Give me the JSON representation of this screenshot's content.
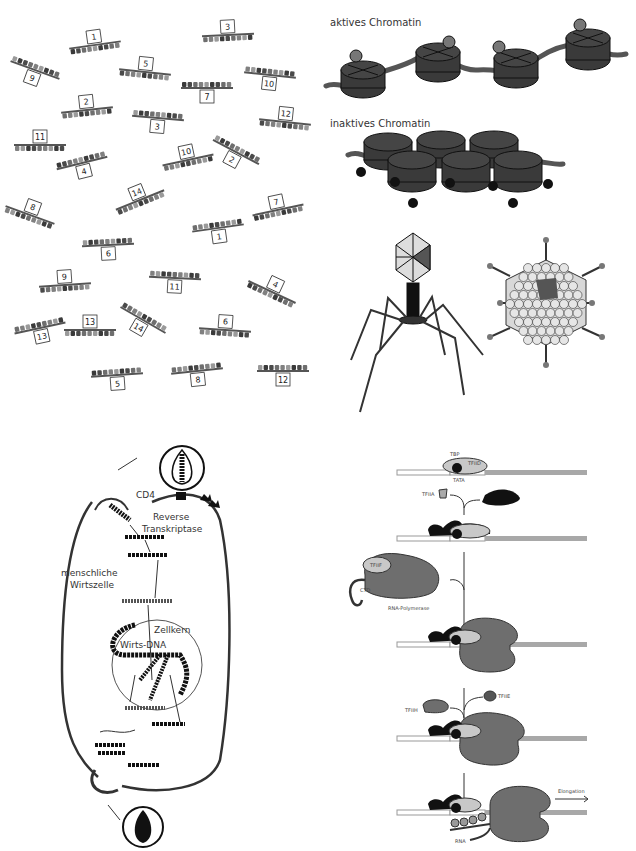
{
  "panels": {
    "genes": {
      "title": "Numbered gene segments",
      "items": [
        {
          "n": "1",
          "x": 95,
          "y": 45,
          "rot": -8,
          "box": "top"
        },
        {
          "n": "3",
          "x": 228,
          "y": 35,
          "rot": -3,
          "box": "top"
        },
        {
          "n": "9",
          "x": 35,
          "y": 70,
          "rot": 20,
          "box": "bottom"
        },
        {
          "n": "5",
          "x": 145,
          "y": 72,
          "rot": 6,
          "box": "top"
        },
        {
          "n": "10",
          "x": 270,
          "y": 75,
          "rot": 6,
          "box": "bottom"
        },
        {
          "n": "7",
          "x": 207,
          "y": 88,
          "rot": 0,
          "box": "bottom"
        },
        {
          "n": "2",
          "x": 87,
          "y": 110,
          "rot": -6,
          "box": "top"
        },
        {
          "n": "3",
          "x": 158,
          "y": 118,
          "rot": 5,
          "box": "bottom"
        },
        {
          "n": "12",
          "x": 285,
          "y": 122,
          "rot": 6,
          "box": "top"
        },
        {
          "n": "11",
          "x": 40,
          "y": 145,
          "rot": 0,
          "box": "top"
        },
        {
          "n": "4",
          "x": 82,
          "y": 163,
          "rot": -14,
          "box": "bottom"
        },
        {
          "n": "10",
          "x": 188,
          "y": 160,
          "rot": -12,
          "box": "top"
        },
        {
          "n": "2",
          "x": 236,
          "y": 152,
          "rot": 28,
          "box": "bottom"
        },
        {
          "n": "14",
          "x": 140,
          "y": 200,
          "rot": -22,
          "box": "top"
        },
        {
          "n": "8",
          "x": 30,
          "y": 215,
          "rot": 20,
          "box": "top"
        },
        {
          "n": "7",
          "x": 278,
          "y": 210,
          "rot": -12,
          "box": "top"
        },
        {
          "n": "1",
          "x": 218,
          "y": 228,
          "rot": -8,
          "box": "bottom"
        },
        {
          "n": "6",
          "x": 108,
          "y": 245,
          "rot": -3,
          "box": "bottom"
        },
        {
          "n": "9",
          "x": 65,
          "y": 285,
          "rot": -4,
          "box": "top"
        },
        {
          "n": "11",
          "x": 175,
          "y": 278,
          "rot": 3,
          "box": "bottom"
        },
        {
          "n": "4",
          "x": 272,
          "y": 292,
          "rot": 25,
          "box": "top"
        },
        {
          "n": "13",
          "x": 40,
          "y": 328,
          "rot": -12,
          "box": "bottom"
        },
        {
          "n": "13",
          "x": 90,
          "y": 330,
          "rot": 0,
          "box": "top"
        },
        {
          "n": "14",
          "x": 143,
          "y": 320,
          "rot": 30,
          "box": "bottom"
        },
        {
          "n": "6",
          "x": 225,
          "y": 330,
          "rot": 4,
          "box": "top"
        },
        {
          "n": "5",
          "x": 117,
          "y": 375,
          "rot": -4,
          "box": "bottom"
        },
        {
          "n": "8",
          "x": 197,
          "y": 371,
          "rot": -6,
          "box": "bottom"
        },
        {
          "n": "12",
          "x": 283,
          "y": 371,
          "rot": 0,
          "box": "bottom"
        }
      ]
    },
    "chromatin": {
      "active_label": "aktives Chromatin",
      "inactive_label": "inaktives Chromatin"
    },
    "viruses": {
      "left": "bacteriophage",
      "right": "adenovirus"
    },
    "hiv": {
      "labels": {
        "cd4": "CD4",
        "rt_line1": "Reverse",
        "rt_line2": "Transkriptase",
        "host_line1": "menschliche",
        "host_line2": "Wirtszelle",
        "nucleus": "Zellkern",
        "host_dna": "Wirts-DNA"
      }
    },
    "transcription": {
      "labels": {
        "tbp": "TBP",
        "tfiid": "TFIID",
        "tata": "TATA",
        "tfiia": "TFIIA",
        "tfiib": "TFIIB",
        "tfiif": "TFIIF",
        "ctd": "CTD",
        "rnapol": "RNA-Polymerase",
        "tfiie": "TFIIE",
        "tfiih": "TFIIH",
        "elongation": "Elongation",
        "rna": "RNA"
      }
    }
  },
  "colors": {
    "dark": "#3a3a3a",
    "mid": "#6e6e6e",
    "light": "#c8c8c8",
    "black": "#111111",
    "dna_gray": "#a8a8a8"
  }
}
